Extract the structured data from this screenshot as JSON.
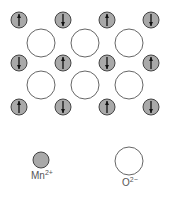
{
  "diagram": {
    "mn_color": "#a9a9a9",
    "mn_stroke": "#444444",
    "o_stroke": "#666666",
    "mn_positions": {
      "xs": [
        19,
        63,
        107,
        151
      ],
      "ys": [
        20,
        63,
        107
      ]
    },
    "spins": [
      [
        "up",
        "down",
        "up",
        "down"
      ],
      [
        "down",
        "up",
        "down",
        "up"
      ],
      [
        "up",
        "down",
        "up",
        "down"
      ]
    ],
    "o_positions": {
      "xs": [
        41,
        85,
        129
      ],
      "ys": [
        43,
        85
      ]
    },
    "mn_radius": 8,
    "o_radius": 14
  },
  "legend": {
    "mn": {
      "label": "Mn",
      "charge": "2+"
    },
    "o": {
      "label": "O",
      "charge": "2−"
    }
  }
}
